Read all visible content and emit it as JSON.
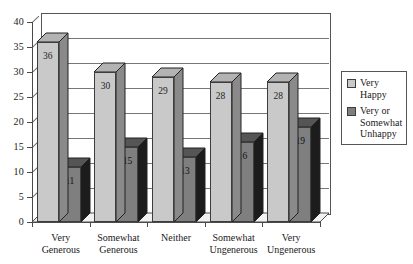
{
  "chart_data": {
    "type": "bar",
    "title": "",
    "subtitle": "",
    "xlabel": "",
    "ylabel": "",
    "ylim": [
      0,
      40
    ],
    "ytick_step": 5,
    "yticks": [
      "0",
      "5",
      "10",
      "15",
      "20",
      "25",
      "30",
      "35",
      "40"
    ],
    "grid": true,
    "style": "3d-clustered-column",
    "legend_position": "right",
    "categories": [
      "Very\nGenerous",
      "Somewhat\nGenerous",
      "Neither",
      "Somewhat\nUngenerous",
      "Very\nUngenerous"
    ],
    "category_lines": [
      [
        "Very",
        "Generous"
      ],
      [
        "Somewhat",
        "Generous"
      ],
      [
        "Neither",
        ""
      ],
      [
        "Somewhat",
        "Ungenerous"
      ],
      [
        "Very",
        "Ungenerous"
      ]
    ],
    "series": [
      {
        "name": "Very Happy",
        "name_lines": [
          "Very",
          "Happy"
        ],
        "color": "#c9c9c9",
        "side_color": "#8a8a8a",
        "top_color": "#b3b3b3",
        "values": [
          36,
          30,
          29,
          28,
          28
        ]
      },
      {
        "name": "Very or Somewhat Unhappy",
        "name_lines": [
          "Very or",
          "Somewhat",
          "Unhappy"
        ],
        "color": "#7f7f7f",
        "side_color": "#1c1c1c",
        "top_color": "#555555",
        "values": [
          11,
          15,
          13,
          16,
          19
        ]
      }
    ]
  },
  "colors": {
    "background": "#ffffff",
    "plot_background": "#ffffff",
    "floor": "#f2f2f2",
    "axis": "#4a4a4a",
    "gridline": "#777777",
    "text": "#1a1a1a",
    "series_light": "#c9c9c9",
    "series_dark": "#7f7f7f"
  }
}
